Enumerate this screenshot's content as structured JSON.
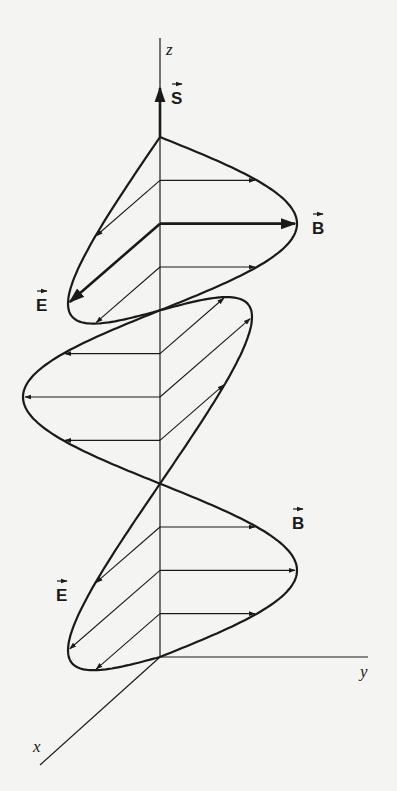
{
  "diagram": {
    "colors": {
      "ink": "#1a1a1a",
      "background": "#f4f4f2"
    },
    "axes": [
      {
        "name": "z",
        "label": "z"
      },
      {
        "name": "y",
        "label": "y"
      },
      {
        "name": "x",
        "label": "x"
      }
    ],
    "vectors": {
      "poynting": {
        "label": "S",
        "symbol": "→",
        "direction": "+z"
      },
      "electric": {
        "label": "E",
        "symbol": "→",
        "oscillation_axis": "x"
      },
      "magnetic": {
        "label": "B",
        "symbol": "→",
        "oscillation_axis": "y"
      }
    },
    "labels": [
      {
        "id": "S-label",
        "text": "S"
      },
      {
        "id": "B-label-top",
        "text": "B"
      },
      {
        "id": "E-label-top",
        "text": "E"
      },
      {
        "id": "B-label-bottom",
        "text": "B"
      },
      {
        "id": "E-label-bottom",
        "text": "E"
      }
    ],
    "wave": {
      "half_wavelengths_shown": 3,
      "field_samples_per_half_wave": [
        0.7071,
        1.0,
        0.7071
      ],
      "phase_relation": "E and B in phase, perpendicular",
      "emphasized_peak": "first"
    }
  }
}
